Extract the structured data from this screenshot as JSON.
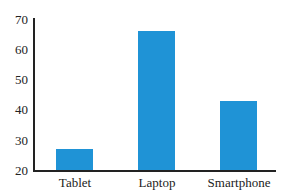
{
  "chart_data": {
    "type": "bar",
    "title": "",
    "xlabel": "",
    "ylabel": "",
    "categories": [
      "Tablet",
      "Laptop",
      "Smartphone"
    ],
    "values": [
      27,
      66,
      43
    ],
    "ylim": [
      20,
      70
    ],
    "yticks": [
      20,
      30,
      40,
      50,
      60,
      70
    ],
    "grid": false,
    "legend": null,
    "bar_color": "#1f93d6"
  },
  "yticks_labels": [
    "70",
    "60",
    "50",
    "40",
    "30",
    "20"
  ],
  "categories_labels": {
    "c0": "Tablet",
    "c1": "Laptop",
    "c2": "Smartphone"
  }
}
